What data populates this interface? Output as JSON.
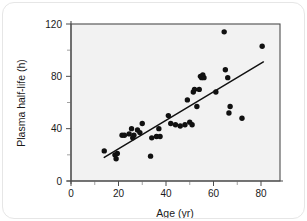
{
  "figure": {
    "background_color": "#ffffff",
    "plot_background_color": "#f2f2f2",
    "point_color": "#111111",
    "line_color": "#111111",
    "axis_color": "#4d4d4d"
  },
  "chart_data": {
    "type": "scatter",
    "title": "",
    "xlabel": "Age (yr)",
    "ylabel": "Plasma half-life (h)",
    "xlim": [
      0,
      88
    ],
    "ylim": [
      0,
      120
    ],
    "xticks": [
      0,
      20,
      40,
      60,
      80
    ],
    "xticklabels": [
      "0",
      "20",
      "40",
      "60",
      "80"
    ],
    "xminorticks": [
      10,
      30,
      50,
      70
    ],
    "yticks": [
      0,
      40,
      80,
      120
    ],
    "yticklabels": [
      "0",
      "40",
      "80",
      "120"
    ],
    "yminorticks": [
      20,
      60,
      100
    ],
    "grid": false,
    "legend": null,
    "points": [
      {
        "x": 14,
        "y": 23
      },
      {
        "x": 18.5,
        "y": 20
      },
      {
        "x": 19,
        "y": 17
      },
      {
        "x": 19.5,
        "y": 21
      },
      {
        "x": 21.5,
        "y": 35
      },
      {
        "x": 22.5,
        "y": 35
      },
      {
        "x": 24.5,
        "y": 36
      },
      {
        "x": 25.5,
        "y": 40
      },
      {
        "x": 26,
        "y": 33
      },
      {
        "x": 26.5,
        "y": 35
      },
      {
        "x": 28,
        "y": 39
      },
      {
        "x": 29,
        "y": 37
      },
      {
        "x": 30,
        "y": 44
      },
      {
        "x": 33.5,
        "y": 19
      },
      {
        "x": 34,
        "y": 33
      },
      {
        "x": 36,
        "y": 34
      },
      {
        "x": 37,
        "y": 40
      },
      {
        "x": 37.5,
        "y": 34
      },
      {
        "x": 41,
        "y": 50
      },
      {
        "x": 42,
        "y": 44
      },
      {
        "x": 44,
        "y": 43
      },
      {
        "x": 46,
        "y": 42
      },
      {
        "x": 48,
        "y": 43
      },
      {
        "x": 49,
        "y": 62
      },
      {
        "x": 50,
        "y": 45
      },
      {
        "x": 51,
        "y": 43
      },
      {
        "x": 51.5,
        "y": 68
      },
      {
        "x": 52,
        "y": 70
      },
      {
        "x": 53,
        "y": 57
      },
      {
        "x": 54,
        "y": 70
      },
      {
        "x": 54.5,
        "y": 80
      },
      {
        "x": 55,
        "y": 79
      },
      {
        "x": 55.5,
        "y": 81
      },
      {
        "x": 56,
        "y": 79
      },
      {
        "x": 61,
        "y": 68
      },
      {
        "x": 64.5,
        "y": 114
      },
      {
        "x": 65,
        "y": 85
      },
      {
        "x": 66,
        "y": 79
      },
      {
        "x": 66.5,
        "y": 52
      },
      {
        "x": 67,
        "y": 57
      },
      {
        "x": 72,
        "y": 48
      },
      {
        "x": 80.5,
        "y": 103
      }
    ],
    "fit_line": {
      "x0": 14,
      "y0": 18,
      "x1": 81,
      "y1": 91
    }
  }
}
